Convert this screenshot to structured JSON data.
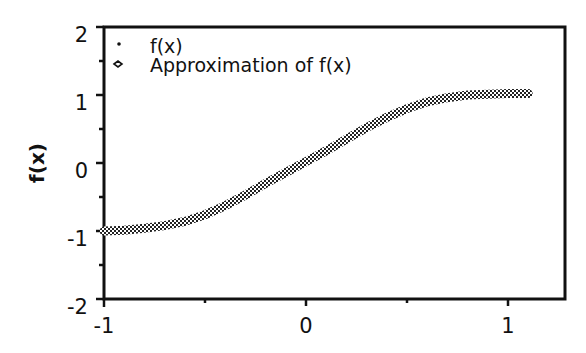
{
  "chart_data": {
    "type": "line",
    "title": "",
    "xlabel": "",
    "ylabel": "f(x)",
    "xlim": [
      -1,
      1.28
    ],
    "ylim": [
      -2,
      2
    ],
    "xticks": [
      -1,
      0,
      1
    ],
    "yticks": [
      -2,
      -1,
      0,
      1,
      2
    ],
    "grid": false,
    "legend_position": "upper left",
    "legend": [
      "f(x)",
      "Approximation of f(x)"
    ],
    "series": [
      {
        "name": "f(x)",
        "marker": "dot",
        "x": [],
        "y": []
      },
      {
        "name": "Approximation of f(x)",
        "marker": "hollow-diamond",
        "x": [
          -1.0,
          -0.9,
          -0.8,
          -0.7,
          -0.6,
          -0.5,
          -0.4,
          -0.3,
          -0.2,
          -0.1,
          0.0,
          0.1,
          0.2,
          0.3,
          0.4,
          0.5,
          0.6,
          0.7,
          0.8,
          0.9,
          1.0,
          1.1
        ],
        "y": [
          -1.0,
          -0.99,
          -0.96,
          -0.92,
          -0.86,
          -0.76,
          -0.63,
          -0.47,
          -0.3,
          -0.14,
          0.02,
          0.18,
          0.35,
          0.52,
          0.67,
          0.8,
          0.9,
          0.96,
          1.0,
          1.01,
          1.02,
          1.02
        ]
      }
    ]
  },
  "axes": {
    "ylabel": "f(x)",
    "x_tick_labels": [
      "-1",
      "0",
      "1"
    ],
    "y_tick_labels": [
      "2",
      "1",
      "0",
      "-1",
      "-2"
    ]
  },
  "legend": {
    "items": [
      {
        "label": "f(x)",
        "symbol": "dot"
      },
      {
        "label": "Approximation of f(x)",
        "symbol": "hollow-diamond"
      }
    ]
  }
}
